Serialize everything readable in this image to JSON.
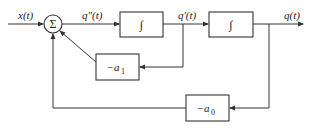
{
  "diagram": {
    "type": "block-diagram",
    "nodes": {
      "summer": {
        "symbol": "Σ"
      },
      "integrator1": {
        "symbol": "∫"
      },
      "integrator2": {
        "symbol": "∫"
      },
      "gain_a1": {
        "label": "−a",
        "subscript": "1"
      },
      "gain_a0": {
        "label": "−a",
        "subscript": "0"
      }
    },
    "signals": {
      "input": "x(t)",
      "second_derivative": "q\"(t)",
      "first_derivative": "q'(t)",
      "output": "q(t)"
    },
    "edges": [
      {
        "from": "input",
        "to": "summer",
        "label": "x(t)"
      },
      {
        "from": "summer",
        "to": "integrator1",
        "label": "q\"(t)"
      },
      {
        "from": "integrator1",
        "to": "integrator2",
        "label": "q'(t)"
      },
      {
        "from": "integrator2",
        "to": "output",
        "label": "q(t)"
      },
      {
        "from": "q'(t)",
        "to": "gain_a1"
      },
      {
        "from": "gain_a1",
        "to": "summer"
      },
      {
        "from": "q(t)",
        "to": "gain_a0"
      },
      {
        "from": "gain_a0",
        "to": "summer"
      }
    ]
  }
}
